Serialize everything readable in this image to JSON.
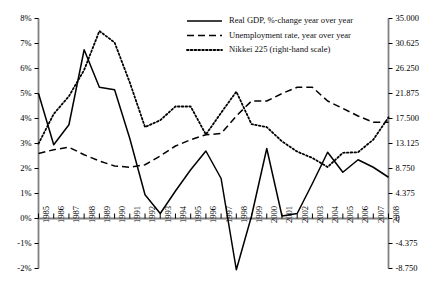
{
  "chart_data": {
    "type": "line",
    "title": "",
    "subtitle": "",
    "xlabel": "",
    "ylabel": "",
    "y2label": "",
    "grid": false,
    "legend_position": "top-center",
    "categories": [
      "1985",
      "1986",
      "1987",
      "1988",
      "1989",
      "1990",
      "1991",
      "1992",
      "1993",
      "1994",
      "1995",
      "1996",
      "1997",
      "1998",
      "1999",
      "2000",
      "2001",
      "2002",
      "2003",
      "2004",
      "2005",
      "2006",
      "2007",
      "2008"
    ],
    "left_axis": {
      "ticks": [
        "8%",
        "7%",
        "6%",
        "5%",
        "4%",
        "3%",
        "2%",
        "1%",
        "0%",
        "-1%",
        "-2%"
      ],
      "tick_values": [
        8,
        7,
        6,
        5,
        4,
        3,
        2,
        1,
        0,
        -1,
        -2
      ],
      "ylim": [
        -2,
        8
      ],
      "unit": "percent"
    },
    "right_axis": {
      "ticks": [
        "35.000",
        "30.625",
        "26.250",
        "21.875",
        "17.500",
        "13.125",
        "8.750",
        "4.375",
        "0",
        "-4.375",
        "-8.750"
      ],
      "tick_values": [
        35000,
        30625,
        26250,
        21875,
        17500,
        13125,
        8750,
        4375,
        0,
        -4375,
        -8750
      ],
      "ylim": [
        -8750,
        35000
      ],
      "unit": "index"
    },
    "series": [
      {
        "name": "Real GDP, %-change year over year",
        "key": "gdp",
        "axis": "left",
        "style": "solid",
        "color": "#000000",
        "values": [
          5.0,
          2.95,
          3.75,
          6.75,
          5.25,
          5.15,
          3.2,
          0.95,
          0.2,
          1.1,
          1.95,
          2.7,
          1.6,
          -2.05,
          0.1,
          2.8,
          0.1,
          0.2,
          1.4,
          2.65,
          1.85,
          2.35,
          2.05,
          1.65
        ]
      },
      {
        "name": "Unemployment rate, year over year",
        "key": "unemployment",
        "axis": "left",
        "style": "dashed",
        "color": "#000000",
        "values": [
          2.6,
          2.75,
          2.85,
          2.55,
          2.3,
          2.1,
          2.05,
          2.15,
          2.5,
          2.9,
          3.15,
          3.35,
          3.4,
          4.1,
          4.7,
          4.7,
          5.0,
          5.25,
          5.25,
          4.7,
          4.4,
          4.1,
          3.85,
          3.85
        ]
      },
      {
        "name": "Nikkei 225 (right-hand scale)",
        "key": "nikkei",
        "axis": "right",
        "style": "dotted",
        "color": "#000000",
        "values": [
          13100,
          18300,
          21400,
          26000,
          32800,
          30800,
          23800,
          16000,
          17200,
          19600,
          19600,
          14700,
          18500,
          22200,
          16500,
          16000,
          13500,
          11700,
          10600,
          9000,
          11500,
          11600,
          13800,
          17700
        ]
      }
    ],
    "nikkei_left_scale_equiv": [
      3.0,
      4.18,
      4.9,
      5.95,
      7.5,
      7.04,
      5.44,
      3.66,
      3.93,
      4.48,
      4.48,
      3.36,
      4.23,
      5.08,
      3.77,
      3.66,
      3.09,
      2.68,
      2.42,
      2.06,
      2.63,
      2.65,
      3.15,
      4.05
    ]
  },
  "legend": {
    "items": [
      {
        "label": "Real GDP, %-change year over year",
        "style": "solid"
      },
      {
        "label": "Unemployment rate, year over year",
        "style": "dashed"
      },
      {
        "label": "Nikkei 225 (right-hand scale)",
        "style": "dotted"
      }
    ]
  },
  "colors": {
    "line": "#000000",
    "axis": "#808080",
    "tick": "#000000",
    "background": "#ffffff"
  }
}
